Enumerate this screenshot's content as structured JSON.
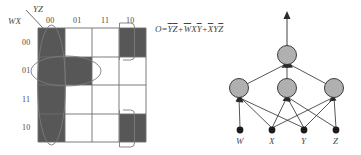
{
  "figure": {
    "kmap": {
      "col_var_label": "YZ",
      "row_var_label": "WX",
      "col_headers": [
        "00",
        "01",
        "11",
        "10"
      ],
      "row_headers": [
        "00",
        "01",
        "11",
        "10"
      ],
      "cells": [
        [
          1,
          0,
          0,
          1
        ],
        [
          1,
          1,
          0,
          0
        ],
        [
          1,
          0,
          0,
          0
        ],
        [
          1,
          0,
          0,
          1
        ]
      ],
      "filled_color": "#575757",
      "grid_color": "#6b6b6b",
      "groups": [
        {
          "name": "column-00-group",
          "shape": "vertical-oval",
          "cells": "col 00, rows 00-10"
        },
        {
          "name": "row-01-group",
          "shape": "horizontal-oval",
          "cells": "row 01, cols 00-01"
        },
        {
          "name": "column-10-wrap-group",
          "shape": "wrap-around-brackets",
          "cells": "col 10, rows 00 and 10"
        }
      ]
    },
    "equation": {
      "output": "O",
      "equals": "=",
      "terms": [
        {
          "id": "term-1",
          "factors": [
            {
              "var": "Y",
              "bar": true
            },
            {
              "var": "Z",
              "bar": true
            }
          ]
        },
        {
          "id": "term-2",
          "factors": [
            {
              "var": "W",
              "bar": true
            },
            {
              "var": "X",
              "bar": false
            },
            {
              "var": "Y",
              "bar": true
            }
          ]
        },
        {
          "id": "term-3",
          "factors": [
            {
              "var": "X",
              "bar": true
            },
            {
              "var": "Y",
              "bar": false
            },
            {
              "var": "Z",
              "bar": true
            }
          ]
        }
      ],
      "plain_text": "O=YZ+WXY+XYZ"
    },
    "network": {
      "output_node": {
        "name": "output-node",
        "fill": "#b0b0b0"
      },
      "hidden_nodes": [
        {
          "name": "hidden-node-1",
          "fill": "#b0b0b0"
        },
        {
          "name": "hidden-node-2",
          "fill": "#b0b0b0"
        },
        {
          "name": "hidden-node-3",
          "fill": "#b0b0b0"
        }
      ],
      "input_nodes": [
        {
          "name": "input-node-w",
          "label": "W",
          "fill": "#1a1a1a"
        },
        {
          "name": "input-node-x",
          "label": "X",
          "fill": "#1a1a1a"
        },
        {
          "name": "input-node-y",
          "label": "Y",
          "fill": "#1a1a1a"
        },
        {
          "name": "input-node-z",
          "label": "Z",
          "fill": "#1a1a1a"
        }
      ],
      "edge_color": "#2a2a2a"
    }
  }
}
